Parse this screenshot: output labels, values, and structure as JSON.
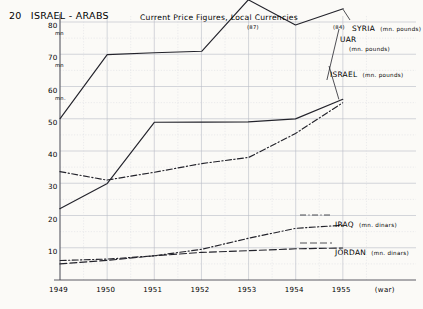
{
  "header": {
    "figure_number": "20",
    "title": "ISRAEL - ARABS",
    "subtitle": "Current Price Figures, Local Currencies"
  },
  "axes": {
    "y_ticks": [
      {
        "value": 80,
        "label": "80",
        "unit": "mn"
      },
      {
        "value": 70,
        "label": "70",
        "unit": "mn"
      },
      {
        "value": 60,
        "label": "60",
        "unit": "mn."
      },
      {
        "value": 50,
        "label": "50",
        "unit": ""
      },
      {
        "value": 40,
        "label": "40",
        "unit": ""
      },
      {
        "value": 30,
        "label": "30",
        "unit": ""
      },
      {
        "value": 20,
        "label": "20",
        "unit": ""
      },
      {
        "value": 10,
        "label": "10",
        "unit": ""
      }
    ],
    "x_ticks": [
      "1949",
      "1950",
      "1951",
      "1952",
      "1953",
      "1954",
      "1955"
    ],
    "x_extra_label": "(war)"
  },
  "annotations": [
    {
      "name": "syria-peak-value",
      "text": "(87)"
    },
    {
      "name": "syria-legend-value",
      "text": "(84)"
    }
  ],
  "legend": [
    {
      "key": "syria",
      "label": "SYRIA",
      "unit": "(mn. pounds)"
    },
    {
      "key": "uar",
      "label": "UAR",
      "unit": "(mn. pounds)"
    },
    {
      "key": "israel",
      "label": "ISRAEL",
      "unit": "(mn. pounds)"
    },
    {
      "key": "iraq",
      "label": "IRAQ",
      "unit": "(mn. dinars)"
    },
    {
      "key": "jordan",
      "label": "JORDAN",
      "unit": "(mn. dinars)"
    }
  ],
  "chart_data": {
    "type": "line",
    "title": "ISRAEL - ARABS",
    "subtitle": "Current Price Figures, Local Currencies",
    "xlabel": "",
    "ylabel": "",
    "x": [
      "1949",
      "1950",
      "1951",
      "1952",
      "1953",
      "1954",
      "1955"
    ],
    "ylim": [
      0,
      85
    ],
    "xlim": [
      "1949",
      "1955"
    ],
    "grid": true,
    "legend_position": "right-inline",
    "series": [
      {
        "name": "SYRIA",
        "unit": "mn. pounds",
        "style": "solid",
        "values": [
          50,
          70,
          70.5,
          71,
          87,
          79,
          84
        ],
        "notes": "1953 peak of 87 drawn above the 80 gridline (off-scale)"
      },
      {
        "name": "UAR",
        "unit": "mn. pounds",
        "style": "dash-dot",
        "values": [
          33.5,
          31,
          33.5,
          36,
          38,
          45.5,
          55
        ]
      },
      {
        "name": "ISRAEL",
        "unit": "mn. pounds",
        "style": "solid",
        "values": [
          22,
          30,
          49,
          49,
          49,
          50,
          56
        ]
      },
      {
        "name": "IRAQ",
        "unit": "mn. dinars",
        "style": "dash-dot",
        "values": [
          6,
          6.5,
          7.5,
          9.5,
          13,
          16,
          17
        ]
      },
      {
        "name": "JORDAN",
        "unit": "mn. dinars",
        "style": "long-dash",
        "values": [
          5,
          6,
          7.5,
          8.5,
          9,
          9.6,
          10
        ]
      }
    ]
  }
}
